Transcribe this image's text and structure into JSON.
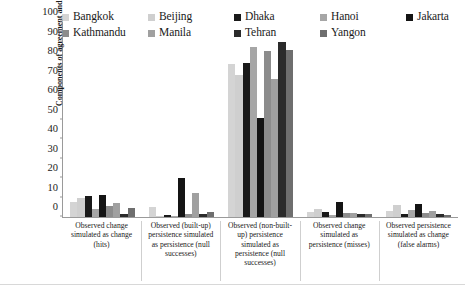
{
  "chart_data": {
    "type": "bar",
    "title": "",
    "subtitle": "",
    "xlabel": "",
    "ylabel": "Components of agreement and disagreements (%)",
    "ylim": [
      0,
      100
    ],
    "ytick_step": 10,
    "yticks": [
      0,
      10,
      20,
      30,
      40,
      50,
      60,
      70,
      80,
      90,
      100
    ],
    "grid": false,
    "legend_position": "top",
    "categories": [
      "Observed change simulated as change (hits)",
      "Observed (built-up) persistence simulated as persistence (null successes)",
      "Observed (non-built-up) persistence simulated as persistence (null successes)",
      "Observed change simulated as persistence (misses)",
      "Observed persistence simulated as change (false alarms)"
    ],
    "series": [
      {
        "name": "Bangkok",
        "color": "#d4d4d4",
        "values": [
          7.5,
          5.0,
          78.5,
          2.5,
          3.2
        ]
      },
      {
        "name": "Beijing",
        "color": "#cfcfcf",
        "values": [
          9.5,
          0.3,
          73.0,
          4.0,
          6.0
        ]
      },
      {
        "name": "Dhaka",
        "color": "#1a1a1a",
        "values": [
          11.0,
          1.0,
          78.8,
          2.8,
          1.5
        ]
      },
      {
        "name": "Hanoi",
        "color": "#a6a6a6",
        "values": [
          4.0,
          0.5,
          87.0,
          1.0,
          3.5
        ]
      },
      {
        "name": "Jakarta",
        "color": "#141414",
        "values": [
          11.5,
          20.0,
          51.0,
          7.5,
          6.5
        ]
      },
      {
        "name": "Kathmandu",
        "color": "#8c8c8c",
        "values": [
          5.5,
          1.5,
          85.0,
          2.0,
          2.0
        ]
      },
      {
        "name": "Manila",
        "color": "#a0a0a0",
        "values": [
          7.0,
          12.5,
          71.0,
          2.2,
          3.0
        ]
      },
      {
        "name": "Tehran",
        "color": "#2b2b2b",
        "values": [
          1.5,
          1.5,
          90.0,
          1.5,
          1.5
        ]
      },
      {
        "name": "Yangon",
        "color": "#6e6e6e",
        "values": [
          4.5,
          2.5,
          85.5,
          1.8,
          1.2
        ]
      }
    ]
  },
  "legend": {
    "items": [
      {
        "label": "Bangkok"
      },
      {
        "label": "Beijing"
      },
      {
        "label": "Dhaka"
      },
      {
        "label": "Hanoi"
      },
      {
        "label": "Jakarta"
      },
      {
        "label": "Kathmandu"
      },
      {
        "label": "Manila"
      },
      {
        "label": "Tehran"
      },
      {
        "label": "Yangon"
      }
    ]
  }
}
